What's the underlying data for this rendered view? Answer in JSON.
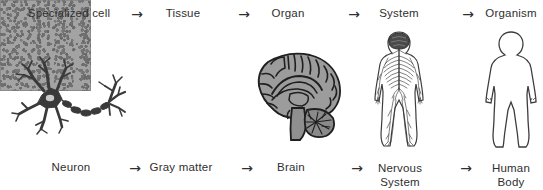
{
  "diagram": {
    "background_color": "#ffffff",
    "text_color": "#2f2f2f",
    "arrow_glyph": "→",
    "levels": [
      {
        "level_label": "Specialized cell",
        "example_label": "Neuron",
        "figure": "neuron-illustration"
      },
      {
        "level_label": "Tissue",
        "example_label": "Gray matter",
        "figure": "gray-matter-micrograph"
      },
      {
        "level_label": "Organ",
        "example_label": "Brain",
        "figure": "brain-illustration"
      },
      {
        "level_label": "System",
        "example_label": "Nervous System",
        "example_label_line1": "Nervous",
        "example_label_line2": "System",
        "figure": "nervous-system-illustration"
      },
      {
        "level_label": "Organism",
        "example_label": "Human Body",
        "example_label_line1": "Human",
        "example_label_line2": "Body",
        "figure": "human-body-illustration"
      }
    ],
    "colors": {
      "ink": "#2f2f2f",
      "neuron_dark": "#3a3a3a",
      "micrograph_base": "#a3a3a3",
      "micrograph_speckle": "#6e6e6e",
      "brain_fill": "#9a9a9a",
      "outline": "#3d3d3d"
    }
  }
}
